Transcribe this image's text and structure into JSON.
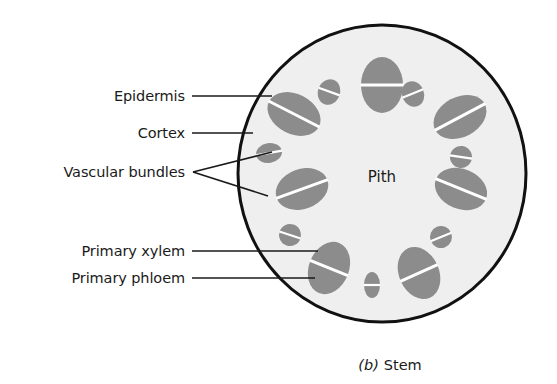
{
  "figure": {
    "caption_index": "(b)",
    "caption_text": "Stem",
    "caption_x": 390,
    "caption_y": 357
  },
  "colors": {
    "background": "#ffffff",
    "cortex_fill": "#efefef",
    "outline": "#111111",
    "bundle_fill": "#8c8c8c",
    "bundle_split": "#ffffff",
    "leader_line": "#1a1a1a",
    "text": "#1a1a1a"
  },
  "stem": {
    "cx": 382,
    "cy": 173.5,
    "rx": 144,
    "ry": 148.5,
    "outline_width": 3,
    "pith_label": "Pith",
    "pith_x": 382,
    "pith_y": 177
  },
  "labels": [
    {
      "id": "epidermis",
      "text": "Epidermis",
      "x": 185,
      "y": 96,
      "leader": [
        [
          192,
          96
        ],
        [
          272,
          96
        ]
      ]
    },
    {
      "id": "cortex",
      "text": "Cortex",
      "x": 185,
      "y": 133,
      "leader": [
        [
          192,
          133
        ],
        [
          253,
          133
        ]
      ]
    },
    {
      "id": "vascular-bundles",
      "text": "Vascular bundles",
      "x": 185,
      "y": 172,
      "leader": [
        [
          193,
          172
        ],
        [
          272,
          152
        ]
      ],
      "leader2": [
        [
          193,
          172
        ],
        [
          268,
          196
        ]
      ]
    },
    {
      "id": "primary-xylem",
      "text": "Primary xylem",
      "x": 185,
      "y": 251,
      "leader": [
        [
          192,
          251
        ],
        [
          318,
          251
        ]
      ]
    },
    {
      "id": "primary-phloem",
      "text": "Primary phloem",
      "x": 185,
      "y": 278,
      "leader": [
        [
          192,
          278
        ],
        [
          315,
          278
        ]
      ]
    }
  ],
  "bundles": [
    {
      "id": "bundle-top",
      "cx": 382,
      "cy": 85,
      "rx": 21,
      "ry": 28,
      "rot": 0,
      "split": 0.5,
      "size": "large"
    },
    {
      "id": "bundle-upper-right",
      "cx": 460,
      "cy": 117,
      "rx": 28,
      "ry": 20,
      "rot": -28,
      "split": 0.5,
      "size": "large"
    },
    {
      "id": "bundle-right",
      "cx": 461,
      "cy": 189,
      "rx": 27,
      "ry": 20,
      "rot": 22,
      "split": 0.5,
      "size": "large"
    },
    {
      "id": "bundle-lower-right",
      "cx": 419,
      "cy": 273,
      "rx": 20,
      "ry": 27,
      "rot": -24,
      "split": 0.5,
      "size": "large"
    },
    {
      "id": "bundle-lower-left",
      "cx": 329,
      "cy": 268,
      "rx": 20,
      "ry": 27,
      "rot": 22,
      "split": 0.5,
      "size": "large"
    },
    {
      "id": "bundle-left",
      "cx": 302,
      "cy": 189,
      "rx": 27,
      "ry": 20,
      "rot": -20,
      "split": 0.5,
      "size": "large"
    },
    {
      "id": "bundle-upper-left",
      "cx": 294,
      "cy": 114,
      "rx": 28,
      "ry": 20,
      "rot": 27,
      "split": 0.5,
      "size": "large"
    },
    {
      "id": "bundle-small-tl",
      "cx": 329,
      "cy": 92,
      "rx": 11,
      "ry": 13,
      "rot": 20,
      "split": 0.48,
      "size": "small"
    },
    {
      "id": "bundle-small-tr",
      "cx": 413,
      "cy": 94,
      "rx": 11,
      "ry": 13,
      "rot": -22,
      "split": 0.48,
      "size": "small"
    },
    {
      "id": "bundle-small-ml",
      "cx": 269,
      "cy": 153,
      "rx": 13,
      "ry": 10,
      "rot": -10,
      "split": 0.5,
      "size": "small"
    },
    {
      "id": "bundle-small-mr",
      "cx": 461,
      "cy": 157,
      "rx": 11,
      "ry": 11,
      "rot": 8,
      "split": 0.5,
      "size": "small"
    },
    {
      "id": "bundle-small-bl",
      "cx": 290,
      "cy": 235,
      "rx": 11,
      "ry": 11,
      "rot": 18,
      "split": 0.5,
      "size": "small"
    },
    {
      "id": "bundle-small-br",
      "cx": 441,
      "cy": 237,
      "rx": 11,
      "ry": 11,
      "rot": -22,
      "split": 0.5,
      "size": "small"
    },
    {
      "id": "bundle-small-bottom",
      "cx": 372,
      "cy": 285,
      "rx": 8,
      "ry": 13,
      "rot": 0,
      "split": 0.5,
      "size": "small"
    }
  ]
}
